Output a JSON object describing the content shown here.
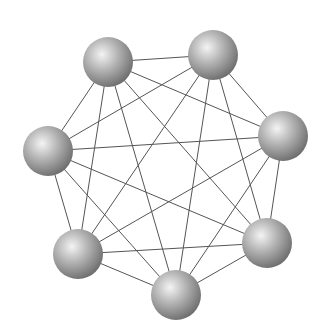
{
  "diagram": {
    "type": "complete-graph",
    "background": "#ffffff",
    "edge_color": "#555555",
    "sphere_highlight": "#f4f4f4",
    "sphere_mid": "#b4b4b4",
    "sphere_shadow": "#6a6a6a",
    "node_radius": 25,
    "nodes": [
      {
        "id": "n1",
        "x": 108,
        "y": 62
      },
      {
        "id": "n2",
        "x": 213,
        "y": 55
      },
      {
        "id": "n3",
        "x": 283,
        "y": 136
      },
      {
        "id": "n4",
        "x": 48,
        "y": 151
      },
      {
        "id": "n5",
        "x": 78,
        "y": 254
      },
      {
        "id": "n6",
        "x": 267,
        "y": 243
      },
      {
        "id": "n7",
        "x": 176,
        "y": 295
      }
    ]
  }
}
